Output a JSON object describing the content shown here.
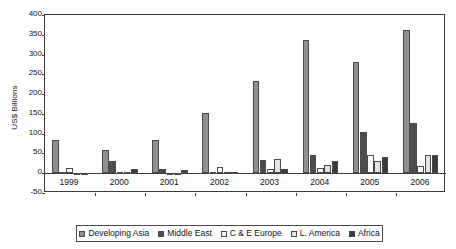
{
  "chart_data": {
    "type": "bar",
    "title": "",
    "subtitle": "",
    "xlabel": "",
    "ylabel": "US$ Billions",
    "categories": [
      "1999",
      "2000",
      "2001",
      "2002",
      "2003",
      "2004",
      "2005",
      "2006"
    ],
    "ylim": [
      -50,
      400
    ],
    "ytick_step": 50,
    "yticks": [
      "400",
      "350",
      "300",
      "250",
      "200",
      "150",
      "100",
      "50",
      "0",
      "-50"
    ],
    "grid": false,
    "legend_position": "bottom",
    "orientation": "vertical",
    "series": [
      {
        "name": "Developing Asia",
        "color": "#8f8f8f",
        "values": [
          84,
          58,
          84,
          153,
          233,
          338,
          282,
          363
        ]
      },
      {
        "name": "Middle East",
        "color": "#4d4d4d",
        "values": [
          2,
          31,
          11,
          2,
          33,
          45,
          105,
          128
        ]
      },
      {
        "name": "C & E Europe",
        "color": "#ffffff",
        "values": [
          12,
          4,
          1,
          17,
          10,
          13,
          47,
          19
        ]
      },
      {
        "name": "L. America",
        "color": "#e3e3e3",
        "values": [
          -5,
          2,
          -4,
          2,
          35,
          21,
          31,
          45
        ]
      },
      {
        "name": "Africa",
        "color": "#3a3a3a",
        "values": [
          0,
          11,
          8,
          4,
          10,
          31,
          41,
          47
        ]
      }
    ]
  },
  "axis": {
    "y_title": "US$ Billions"
  }
}
